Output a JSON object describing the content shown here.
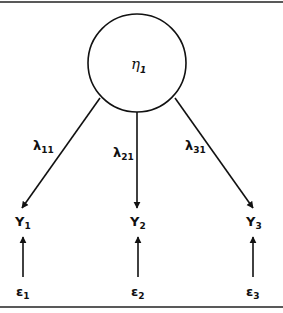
{
  "diagram": {
    "type": "measurement model (single latent factor)",
    "latent": {
      "symbol": "η",
      "subscript": "1"
    },
    "loadings": [
      {
        "symbol": "λ",
        "subscript": "11"
      },
      {
        "symbol": "λ",
        "subscript": "21"
      },
      {
        "symbol": "λ",
        "subscript": "31"
      }
    ],
    "indicators": [
      {
        "symbol": "Y",
        "subscript": "1"
      },
      {
        "symbol": "Y",
        "subscript": "2"
      },
      {
        "symbol": "Y",
        "subscript": "3"
      }
    ],
    "errors": [
      {
        "symbol": "ε",
        "subscript": "1"
      },
      {
        "symbol": "ε",
        "subscript": "2"
      },
      {
        "symbol": "ε",
        "subscript": "3"
      }
    ],
    "colors": {
      "stroke": "#111111",
      "background": "#ffffff"
    }
  }
}
